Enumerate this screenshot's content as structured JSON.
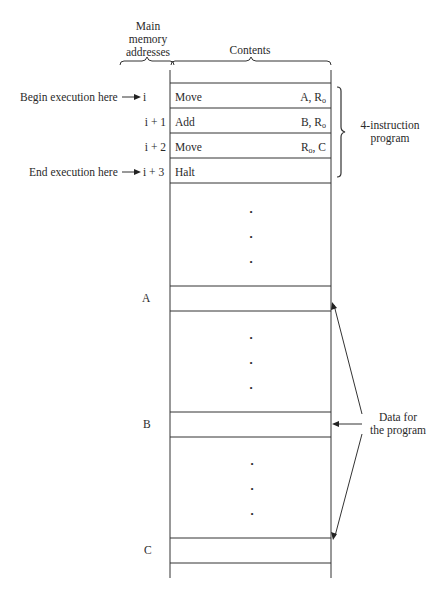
{
  "header": {
    "addresses_label": [
      "Main",
      "memory",
      "addresses"
    ],
    "contents_label": "Contents"
  },
  "pointers": {
    "begin": "Begin execution here",
    "end": "End execution here"
  },
  "program": [
    {
      "address": "i",
      "opcode": "Move",
      "operand_main": "A, R",
      "operand_sub": "o",
      "operand_tail": ""
    },
    {
      "address": "i + 1",
      "opcode": "Add",
      "operand_main": "B, R",
      "operand_sub": "o",
      "operand_tail": ""
    },
    {
      "address": "i + 2",
      "opcode": "Move",
      "operand_main": "R",
      "operand_sub": "o",
      "operand_tail": ", C"
    },
    {
      "address": "i + 3",
      "opcode": "Halt",
      "operand_main": "",
      "operand_sub": "",
      "operand_tail": ""
    }
  ],
  "program_brace_label": [
    "4-instruction",
    "program"
  ],
  "data_locations": [
    {
      "address": "A"
    },
    {
      "address": "B"
    },
    {
      "address": "C"
    }
  ],
  "data_label": [
    "Data for",
    "the program"
  ],
  "ellipsis": "•"
}
